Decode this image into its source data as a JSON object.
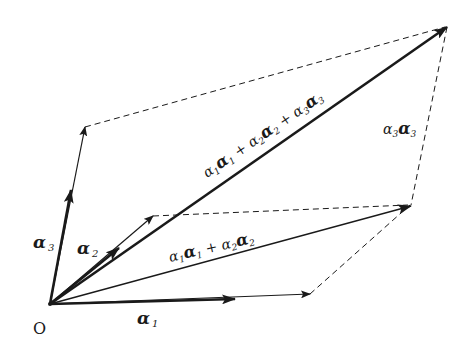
{
  "diagram": {
    "type": "vector-parallelepiped",
    "colors": {
      "stroke": "#1a1a1a",
      "background": "#ffffff"
    },
    "origin": {
      "label": "O",
      "x": 50,
      "y": 304
    },
    "vectors": [
      {
        "id": "a1",
        "label_coef": "",
        "label_vec": "α",
        "label_sub": "1",
        "base_tip": [
          232,
          299
        ],
        "scaled_tip": [
          310,
          294
        ]
      },
      {
        "id": "a2",
        "label_coef": "",
        "label_vec": "α",
        "label_sub": "2",
        "base_tip": [
          118,
          250
        ],
        "scaled_tip": [
          153,
          216
        ]
      },
      {
        "id": "a3",
        "label_coef": "",
        "label_vec": "α",
        "label_sub": "3",
        "base_tip": [
          70,
          192
        ],
        "scaled_tip": [
          85,
          127
        ]
      },
      {
        "id": "sum12",
        "tip": [
          410,
          206
        ]
      },
      {
        "id": "sum123",
        "tip": [
          447,
          27
        ]
      }
    ],
    "labels": {
      "origin": "O",
      "a1": {
        "main": "α",
        "sub": "1"
      },
      "a2": {
        "main": "α",
        "sub": "2"
      },
      "a3": {
        "main": "α",
        "sub": "3"
      },
      "sum12": {
        "t1": "α",
        "s1": "1",
        "t2": "α",
        "s2": "1",
        "plus": " + ",
        "t3": "α",
        "s3": "2",
        "t4": "α",
        "s4": "2"
      },
      "sum123": {
        "t1": "α",
        "s1": "1",
        "t2": "α",
        "s2": "1",
        "plus1": " + ",
        "t3": "α",
        "s3": "2",
        "t4": "α",
        "s4": "2",
        "plus2": " + ",
        "t5": "α",
        "s5": "3",
        "t6": "α",
        "s6": "3"
      },
      "a3a3": {
        "t1": "α",
        "s1": "3",
        "t2": "α",
        "s2": "3"
      }
    },
    "dashed_edges": [
      [
        [
          85,
          127
        ],
        [
          445,
          27
        ]
      ],
      [
        [
          153,
          216
        ],
        [
          408,
          205
        ]
      ],
      [
        [
          310,
          294
        ],
        [
          410,
          205
        ]
      ],
      [
        [
          447,
          27
        ],
        [
          411,
          205
        ]
      ]
    ]
  }
}
